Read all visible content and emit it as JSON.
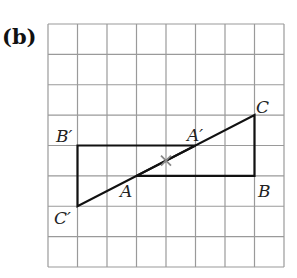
{
  "part_label": "(b)",
  "grid": {
    "x0": 48,
    "y0": 24,
    "x1": 284,
    "y1": 267,
    "cols": 8,
    "rows": 8,
    "color": "#9a9a9a"
  },
  "points": {
    "A": {
      "label": "A",
      "col": 3,
      "row": 5
    },
    "B": {
      "label": "B",
      "col": 7,
      "row": 5
    },
    "C": {
      "label": "C",
      "col": 7,
      "row": 3
    },
    "A_prime": {
      "label": "A′",
      "col": 5,
      "row": 4
    },
    "B_prime": {
      "label": "B′",
      "col": 1,
      "row": 4
    },
    "C_prime": {
      "label": "C′",
      "col": 1,
      "row": 6
    }
  },
  "center_mark": {
    "symbol": "cross",
    "col": 4,
    "row": 4.5,
    "color": "#888888"
  },
  "line_color": "#111111"
}
